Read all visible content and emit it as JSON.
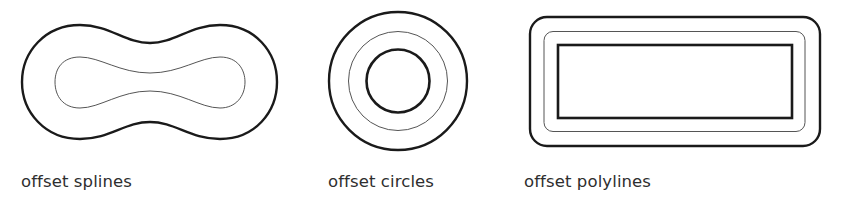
{
  "figure": {
    "panels": [
      {
        "id": "splines",
        "label": "offset splines",
        "shape": "spline",
        "curves": [
          "outer offset (thick)",
          "inner offset (thin)"
        ]
      },
      {
        "id": "circles",
        "label": "offset circles",
        "shape": "circle",
        "curves": [
          "outer offset (thick)",
          "middle offset (thin)",
          "inner original (thick)"
        ]
      },
      {
        "id": "polylines",
        "label": "offset polylines",
        "shape": "polyline",
        "curves": [
          "outer offset (thick, rounded corners)",
          "middle offset (thin, rounded corners)",
          "inner original rectangle (thick)"
        ]
      }
    ],
    "colors": {
      "stroke": "#1a1a1a",
      "thin_stroke": "#555555",
      "label": "#2e2e2e",
      "background": "#ffffff"
    }
  }
}
